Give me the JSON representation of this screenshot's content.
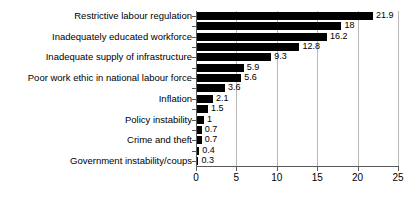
{
  "chart_data": {
    "type": "bar",
    "orientation": "horizontal",
    "title": "",
    "subtitle": "",
    "xlabel": "",
    "ylabel": "",
    "xlim": [
      0,
      25
    ],
    "xticks": [
      0,
      5,
      10,
      15,
      20,
      25
    ],
    "xtick_labels": [
      "0",
      "5",
      "10",
      "15",
      "20",
      "25"
    ],
    "grid": "vertical",
    "legend": "none",
    "bar_color": "#000000",
    "gridline_color": "#b8b8b8",
    "axis_color": "#5a5a5a",
    "background": "#ffffff",
    "categories": [
      "Restrictive labour regulation",
      "",
      "Inadequately educated workforce",
      "",
      "Inadequate supply of infrastructure",
      "",
      "Poor work ethic in national labour force",
      "",
      "Inflation",
      "",
      "Policy instability",
      "",
      "Crime and theft",
      "",
      "Government instability/coups"
    ],
    "values": [
      21.9,
      18,
      16.2,
      12.8,
      9.3,
      5.9,
      5.6,
      3.6,
      2.1,
      1.5,
      1,
      0.7,
      0.7,
      0.4,
      0.3
    ],
    "value_labels": [
      "21.9",
      "18",
      "16.2",
      "12.8",
      "9.3",
      "5.9",
      "5.6",
      "3.6",
      "2.1",
      "1.5",
      "1",
      "0.7",
      "0.7",
      "0.4",
      "0.3"
    ],
    "visible_category_labels": [
      "Restrictive labour regulation",
      "Inadequately educated workforce",
      "Inadequate supply of infrastructure",
      "Poor work ethic in national labour force",
      "Inflation",
      "Policy instability",
      "Crime and theft",
      "Government instability/coups"
    ]
  }
}
